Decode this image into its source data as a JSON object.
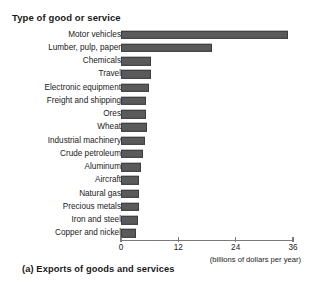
{
  "chart_data": {
    "type": "bar",
    "orientation": "horizontal",
    "title": "Type of good or service",
    "caption": "(a) Exports of goods and services",
    "xlabel": "(billions of dollars per year)",
    "ylabel": "Type of good or service",
    "xlim": [
      0,
      36
    ],
    "xticks": [
      0,
      12,
      24,
      36
    ],
    "xtick_labels": [
      "0",
      "12",
      "24",
      "36"
    ],
    "grid": false,
    "legend": null,
    "bar_color": "#5a5a5a",
    "categories": [
      "Motor vehicles",
      "Lumber, pulp, paper",
      "Chemicals",
      "Travel",
      "Electronic equipment",
      "Freight and shipping",
      "Ores",
      "Wheat",
      "Industrial machinery",
      "Crude petroleum",
      "Aluminum",
      "Aircraft",
      "Natural gas",
      "Precious metals",
      "Iron and steel",
      "Copper and nickel"
    ],
    "values": [
      35,
      19,
      6.3,
      6.3,
      5.8,
      5.2,
      5.2,
      5.4,
      5.0,
      4.6,
      4.2,
      3.8,
      3.8,
      3.8,
      3.5,
      3.1
    ]
  }
}
